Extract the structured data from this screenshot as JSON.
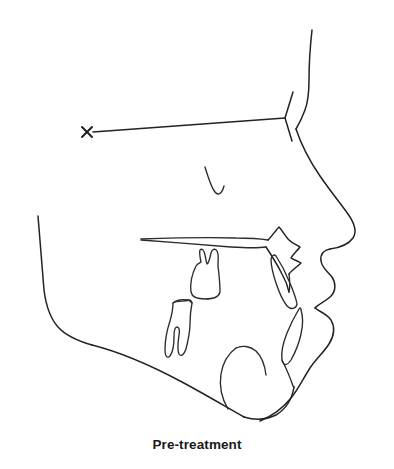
{
  "figure": {
    "kind": "cephalometric-tracing",
    "view": "lateral",
    "caption": "Pre-treatment",
    "background_color": "#ffffff",
    "line_color": "#222222"
  },
  "landmarks": [
    {
      "id": "sella",
      "label": "S",
      "marker": "x-cross",
      "x": 87,
      "y": 132
    },
    {
      "id": "nasion",
      "label": "N",
      "marker": "junction",
      "x": 286,
      "y": 118
    }
  ],
  "reference_lines": [
    {
      "id": "sella-nasion-line",
      "label": "S-N line",
      "from": "sella",
      "to": "nasion"
    }
  ],
  "structures": [
    {
      "id": "cranial-frontal-profile",
      "label": "Frontal bone / forehead profile"
    },
    {
      "id": "sella-turcica",
      "label": "Sella turcica floor"
    },
    {
      "id": "nasal-dorsum",
      "label": "Nasal dorsum"
    },
    {
      "id": "nose-tip",
      "label": "Nose tip / columella"
    },
    {
      "id": "upper-lip",
      "label": "Upper lip soft tissue"
    },
    {
      "id": "lower-lip",
      "label": "Lower lip soft tissue"
    },
    {
      "id": "soft-tissue-chin",
      "label": "Soft tissue chin"
    },
    {
      "id": "hard-palate",
      "label": "Hard palate / palatal plane"
    },
    {
      "id": "maxilla",
      "label": "Maxilla with anterior nasal spine"
    },
    {
      "id": "upper-molar",
      "label": "Upper first molar"
    },
    {
      "id": "lower-molar",
      "label": "Lower first molar"
    },
    {
      "id": "upper-incisor",
      "label": "Upper central incisor"
    },
    {
      "id": "lower-incisor",
      "label": "Lower central incisor"
    },
    {
      "id": "mandibular-ramus",
      "label": "Mandibular ramus posterior border"
    },
    {
      "id": "mandibular-body",
      "label": "Mandibular lower border"
    },
    {
      "id": "symphysis",
      "label": "Mandibular symphysis"
    }
  ]
}
